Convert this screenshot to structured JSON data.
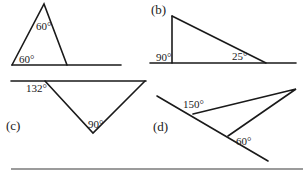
{
  "figure": {
    "panels": [
      {
        "id": "a",
        "label": "",
        "angles": [
          {
            "value": "60°",
            "position": "apex"
          },
          {
            "value": "60°",
            "position": "bottom-left"
          }
        ]
      },
      {
        "id": "b",
        "label": "(b)",
        "angles": [
          {
            "value": "90°",
            "position": "exterior-left-of-vertical"
          },
          {
            "value": "25°",
            "position": "bottom-right"
          }
        ]
      },
      {
        "id": "c",
        "label": "(c)",
        "angles": [
          {
            "value": "132°",
            "position": "exterior-top-left"
          },
          {
            "value": "90°",
            "position": "bottom-vertex"
          }
        ]
      },
      {
        "id": "d",
        "label": "(d)",
        "angles": [
          {
            "value": "150°",
            "position": "exterior-upper-left"
          },
          {
            "value": "60°",
            "position": "lower-vertex"
          }
        ]
      }
    ]
  }
}
